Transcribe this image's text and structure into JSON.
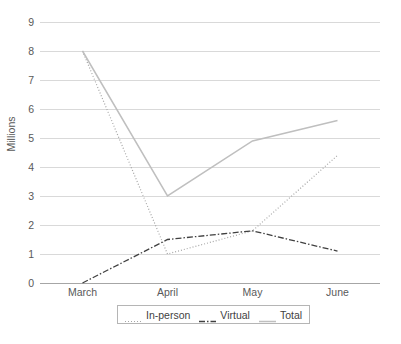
{
  "chart_data": {
    "type": "line",
    "title": "",
    "xlabel": "",
    "ylabel": "Millions",
    "categories": [
      "March",
      "April",
      "May",
      "June"
    ],
    "ylim": [
      0,
      9
    ],
    "ytick_labels": [
      "0",
      "1",
      "2",
      "3",
      "4",
      "5",
      "6",
      "7",
      "8",
      "9"
    ],
    "grid": true,
    "legend_position": "bottom",
    "series": [
      {
        "name": "In-person",
        "style": "dotted",
        "color": "#a6a6a6",
        "values": [
          8,
          1,
          1.8,
          4.4
        ]
      },
      {
        "name": "Virtual",
        "style": "dash-dot",
        "color": "#404040",
        "values": [
          0,
          1.5,
          1.8,
          1.1
        ]
      },
      {
        "name": "Total",
        "style": "solid",
        "color": "#bfbfbf",
        "values": [
          8,
          3,
          4.9,
          5.6
        ]
      }
    ]
  },
  "legend": {
    "items": [
      {
        "label": "In-person"
      },
      {
        "label": "Virtual"
      },
      {
        "label": "Total"
      }
    ]
  },
  "caption": {
    "text": ""
  }
}
